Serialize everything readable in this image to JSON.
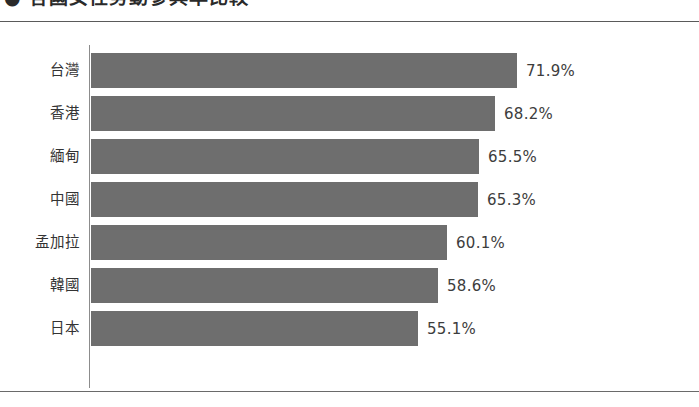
{
  "title": "● 各國女性勞動參與率比較",
  "chart_data": {
    "type": "bar",
    "orientation": "horizontal",
    "title": "● 各國女性勞動參與率比較",
    "xlabel": "",
    "ylabel": "",
    "grid": false,
    "legend": "none",
    "unit": "%",
    "xlim": [
      0,
      75
    ],
    "categories": [
      "台灣",
      "香港",
      "緬甸",
      "中國",
      "孟加拉",
      "韓國",
      "日本"
    ],
    "values": [
      71.9,
      68.2,
      65.5,
      65.3,
      60.1,
      58.6,
      55.1
    ],
    "value_labels": [
      "71.9%",
      "68.2%",
      "65.5%",
      "65.3%",
      "60.1%",
      "58.6%",
      "55.1%"
    ],
    "bar_color": "#6e6e6e",
    "background_color": "#ffffff",
    "axis_color": "#8c8c8c"
  },
  "rows": [
    {
      "label": "台灣",
      "value": 71.9,
      "value_label": "71.9%"
    },
    {
      "label": "香港",
      "value": 68.2,
      "value_label": "68.2%"
    },
    {
      "label": "緬甸",
      "value": 65.5,
      "value_label": "65.5%"
    },
    {
      "label": "中國",
      "value": 65.3,
      "value_label": "65.3%"
    },
    {
      "label": "孟加拉",
      "value": 60.1,
      "value_label": "60.1%"
    },
    {
      "label": "韓國",
      "value": 58.6,
      "value_label": "58.6%"
    },
    {
      "label": "日本",
      "value": 55.1,
      "value_label": "55.1%"
    }
  ]
}
